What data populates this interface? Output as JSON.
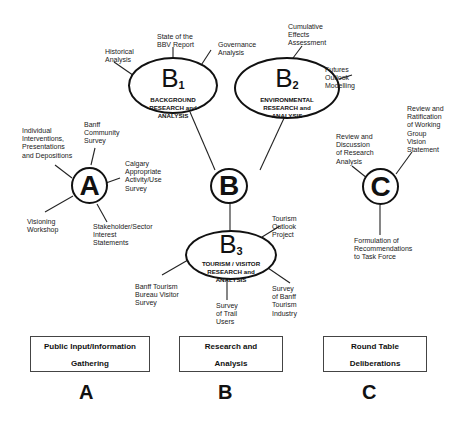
{
  "nodes": {
    "A": {
      "letter": "A"
    },
    "B": {
      "letter": "B"
    },
    "C": {
      "letter": "C"
    }
  },
  "ellipses": {
    "B1": {
      "symbol": "B",
      "subscript": "1",
      "caption": "BACKGROUND\nRESEARCH and\nANALYSIS"
    },
    "B2": {
      "symbol": "B",
      "subscript": "2",
      "caption": "ENVIRONMENTAL\nRESEARCH and\nANALYSIS"
    },
    "B3": {
      "symbol": "B",
      "subscript": "3",
      "caption": "TOURISM / VISITOR\nRESEARCH and\nANALYSIS"
    }
  },
  "labels": {
    "historical_analysis": "Historical\nAnalysis",
    "state_of_bbv_report": "State of the\nBBV Report",
    "governance_analysis": "Governance\nAnalysis",
    "cumulative_effects": "Cumulative\nEffects\nAssessment",
    "futures_outlook": "Futures\nOutlook\nModelling",
    "individual_interventions": "Individual\nInterventions,\nPresentations\nand Depositions",
    "banff_community_survey": "Banff\nCommunity\nSurvey",
    "calgary_survey": "Calgary\nAppropriate\nActivity/Use\nSurvey",
    "visioning_workshop": "Visioning\nWorkshop",
    "stakeholder_statements": "Stakeholder/Sector\nInterest\nStatements",
    "review_discussion": "Review and\nDiscussion\nof Research\nAnalysis",
    "review_ratification": "Review and\nRatification\nof Working\nGroup\nVision\nStatement",
    "formulation_recommendations": "Formulation of\nRecommendations\nto Task Force",
    "tourism_outlook": "Tourism\nOutlook\nProject",
    "banff_tourism_bureau": "Banff Tourism\nBureau Visitor\nSurvey",
    "survey_trail_users": "Survey\nof Trail\nUsers",
    "survey_banff_industry": "Survey\nof Banff\nTourism\nIndustry"
  },
  "boxes": {
    "A": "Public Input/Information\nGathering",
    "B": "Research and\nAnalysis",
    "C": "Round Table\nDeliberations"
  },
  "bottom_letters": {
    "A": "A",
    "B": "B",
    "C": "C"
  }
}
